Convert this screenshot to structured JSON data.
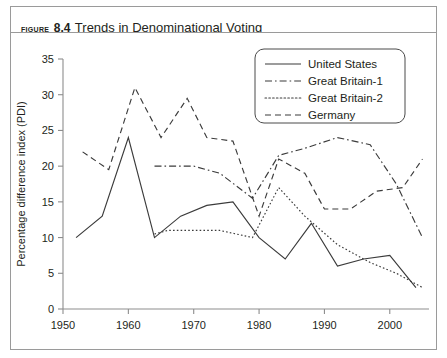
{
  "figure": {
    "label": "Figure",
    "number": "8.4",
    "title": "Trends in Denominational Voting"
  },
  "chart_data": {
    "type": "line",
    "title": "Trends in Denominational Voting",
    "xlabel": "",
    "ylabel": "Percentage difference index (PDI)",
    "xlim": [
      1950,
      2006
    ],
    "ylim": [
      0,
      35
    ],
    "grid": false,
    "legend_position": "top-right",
    "xticks": [
      1950,
      1960,
      1970,
      1980,
      1990,
      2000
    ],
    "yticks": [
      0,
      5,
      10,
      15,
      20,
      25,
      30,
      35
    ],
    "series": [
      {
        "name": "United States",
        "style": "solid",
        "x": [
          1952,
          1956,
          1960,
          1964,
          1968,
          1972,
          1976,
          1980,
          1984,
          1988,
          1992,
          1996,
          2000,
          2004
        ],
        "y": [
          10.0,
          13.0,
          24.0,
          10.0,
          13.0,
          14.5,
          15.0,
          10.0,
          7.0,
          12.0,
          6.0,
          7.0,
          7.5,
          3.0
        ]
      },
      {
        "name": "Great Britain-1",
        "style": "dashdot",
        "x": [
          1964,
          1966,
          1970,
          1974,
          1979,
          1983,
          1987,
          1992,
          1997,
          2001,
          2005
        ],
        "y": [
          20.0,
          20.0,
          20.0,
          19.0,
          15.5,
          21.5,
          22.5,
          24.0,
          23.0,
          17.5,
          10.0
        ]
      },
      {
        "name": "Great Britain-2",
        "style": "dotted",
        "x": [
          1964,
          1966,
          1970,
          1974,
          1979,
          1983,
          1987,
          1992,
          1997,
          2001,
          2005
        ],
        "y": [
          10.5,
          11.0,
          11.0,
          11.0,
          10.0,
          17.0,
          13.0,
          9.0,
          6.5,
          5.0,
          3.0
        ]
      },
      {
        "name": "Germany",
        "style": "dashed",
        "x": [
          1953,
          1957,
          1961,
          1965,
          1969,
          1972,
          1976,
          1980,
          1983,
          1987,
          1990,
          1994,
          1998,
          2002,
          2005
        ],
        "y": [
          22.0,
          19.5,
          31.0,
          24.0,
          29.5,
          24.0,
          23.5,
          13.0,
          21.0,
          19.0,
          14.0,
          14.0,
          16.5,
          17.0,
          21.0
        ]
      }
    ]
  },
  "axes": {
    "y_axis_title": "Percentage difference index (PDI)",
    "y_tick_labels": [
      "0",
      "5",
      "10",
      "15",
      "20",
      "25",
      "30",
      "35"
    ],
    "x_tick_labels": [
      "1950",
      "1960",
      "1970",
      "1980",
      "1990",
      "2000"
    ]
  },
  "legend": {
    "items": [
      {
        "label": "United States",
        "style": "solid"
      },
      {
        "label": "Great Britain-1",
        "style": "dashdot"
      },
      {
        "label": "Great Britain-2",
        "style": "dotted"
      },
      {
        "label": "Germany",
        "style": "dashed"
      }
    ]
  },
  "colors": {
    "line": "#3b3b3b",
    "axis": "#8d8d8d",
    "frame": "#9a9a9a",
    "text": "#231f20",
    "background": "#ffffff"
  }
}
